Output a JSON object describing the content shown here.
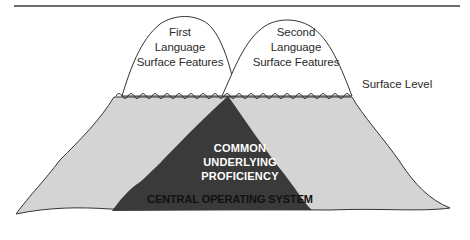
{
  "diagram": {
    "type": "dual-iceberg",
    "peaks": [
      {
        "label_lines": [
          "First",
          "Language",
          "Surface Features"
        ]
      },
      {
        "label_lines": [
          "Second",
          "Language",
          "Surface Features"
        ]
      }
    ],
    "surface_label": "Surface Level",
    "core": {
      "label_lines": [
        "COMMON",
        "UNDERLYING",
        "PROFICIENCY"
      ],
      "base_label": "CENTRAL OPERATING SYSTEM"
    },
    "colors": {
      "above_water": "#ffffff",
      "below_water": "#d4d4d4",
      "core": "#3a3a3a",
      "outline": "#333333"
    }
  }
}
